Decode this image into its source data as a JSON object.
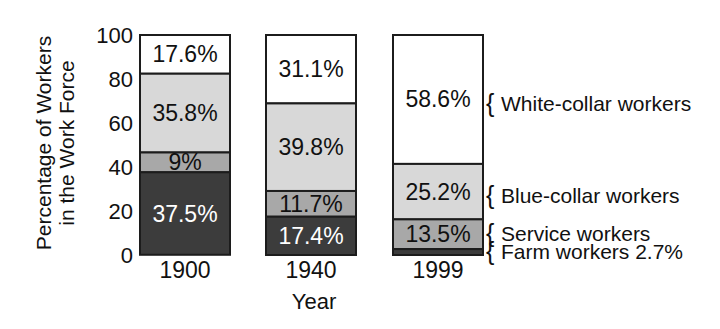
{
  "chart_data": {
    "type": "bar",
    "stacked": true,
    "title": "",
    "xlabel": "Year",
    "ylabel_lines": [
      "Percentage of Workers",
      "in the Work Force"
    ],
    "categories": [
      "1900",
      "1940",
      "1999"
    ],
    "yticks": [
      0,
      20,
      40,
      60,
      80,
      100
    ],
    "ylim": [
      0,
      100
    ],
    "grid": false,
    "legend_position": "right-of-last-bar",
    "series": [
      {
        "name": "Farm workers",
        "color": "#3c3c3c",
        "label_color": "#ffffff",
        "values": [
          37.5,
          17.4,
          2.7
        ],
        "labels": [
          "37.5%",
          "17.4%",
          null
        ]
      },
      {
        "name": "Service workers",
        "color": "#a8a8a8",
        "label_color": "#111111",
        "values": [
          9,
          11.7,
          13.5
        ],
        "labels": [
          "9%",
          "11.7%",
          "13.5%"
        ]
      },
      {
        "name": "Blue-collar workers",
        "color": "#d8d8d8",
        "label_color": "#111111",
        "values": [
          35.8,
          39.8,
          25.2
        ],
        "labels": [
          "35.8%",
          "39.8%",
          "25.2%"
        ]
      },
      {
        "name": "White-collar workers",
        "color": "#ffffff",
        "label_color": "#111111",
        "values": [
          17.6,
          31.1,
          58.6
        ],
        "labels": [
          "17.6%",
          "31.1%",
          "58.6%"
        ]
      }
    ],
    "legend": [
      {
        "brace": "{",
        "text": "White-collar workers"
      },
      {
        "brace": "{",
        "text": "Blue-collar workers"
      },
      {
        "brace": "{",
        "text": "Service workers"
      },
      {
        "brace": "{",
        "text": "Farm workers 2.7%"
      }
    ],
    "colors": {
      "background": "#ffffff",
      "bar_border": "#1c1c1c",
      "text": "#111111",
      "segment_white": "#ffffff",
      "segment_light_gray": "#d8d8d8",
      "segment_medium_gray": "#a8a8a8",
      "segment_dark_gray": "#3c3c3c"
    }
  }
}
